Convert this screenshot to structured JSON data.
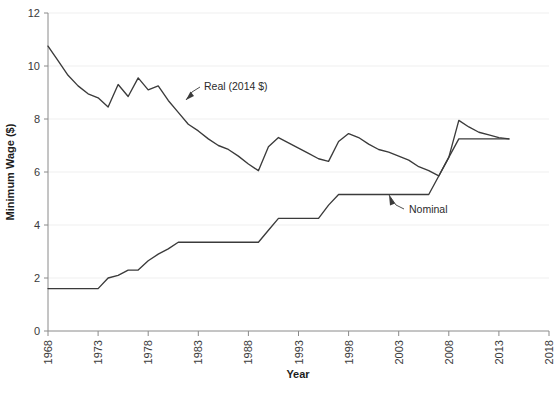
{
  "chart_data": {
    "type": "line",
    "title": "",
    "xlabel": "Year",
    "ylabel": "Minimum Wage ($)",
    "xlim": [
      1968,
      2018
    ],
    "ylim": [
      0,
      12
    ],
    "xticks": [
      1968,
      1973,
      1978,
      1983,
      1988,
      1993,
      1998,
      2003,
      2008,
      2013,
      2018
    ],
    "yticks": [
      0,
      2,
      4,
      6,
      8,
      10,
      12
    ],
    "grid": true,
    "grid_axis": "y",
    "legend": "annotations",
    "annotations": [
      {
        "name": "real-annotation",
        "text": "Real (2014 $)",
        "points_to_year": 1981,
        "points_to_value": 8.25
      },
      {
        "name": "nominal-annotation",
        "text": "Nominal",
        "points_to_year": 2001,
        "points_to_value": 5.15
      }
    ],
    "series": [
      {
        "name": "Real (2014 $)",
        "color": "#3b3b3b",
        "x": [
          1968,
          1969,
          1970,
          1971,
          1972,
          1973,
          1974,
          1975,
          1976,
          1977,
          1978,
          1979,
          1980,
          1981,
          1982,
          1983,
          1984,
          1985,
          1986,
          1987,
          1988,
          1989,
          1990,
          1991,
          1992,
          1993,
          1994,
          1995,
          1996,
          1997,
          1998,
          1999,
          2000,
          2001,
          2002,
          2003,
          2004,
          2005,
          2006,
          2007,
          2008,
          2009,
          2010,
          2011,
          2012,
          2013,
          2014
        ],
        "values": [
          10.75,
          10.2,
          9.65,
          9.25,
          8.95,
          8.8,
          8.45,
          9.3,
          8.85,
          9.55,
          9.1,
          9.25,
          8.7,
          8.25,
          7.8,
          7.55,
          7.25,
          7.0,
          6.85,
          6.6,
          6.3,
          6.05,
          6.95,
          7.3,
          7.1,
          6.9,
          6.7,
          6.5,
          6.4,
          7.15,
          7.45,
          7.3,
          7.05,
          6.85,
          6.75,
          6.6,
          6.45,
          6.2,
          6.05,
          5.85,
          6.55,
          7.95,
          7.7,
          7.5,
          7.4,
          7.3,
          7.25
        ]
      },
      {
        "name": "Nominal",
        "color": "#3b3b3b",
        "x": [
          1968,
          1969,
          1970,
          1971,
          1972,
          1973,
          1974,
          1975,
          1976,
          1977,
          1978,
          1979,
          1980,
          1981,
          1982,
          1983,
          1984,
          1985,
          1986,
          1987,
          1988,
          1989,
          1990,
          1991,
          1992,
          1993,
          1994,
          1995,
          1996,
          1997,
          1998,
          1999,
          2000,
          2001,
          2002,
          2003,
          2004,
          2005,
          2006,
          2007,
          2008,
          2009,
          2010,
          2011,
          2012,
          2013,
          2014
        ],
        "values": [
          1.6,
          1.6,
          1.6,
          1.6,
          1.6,
          1.6,
          2.0,
          2.1,
          2.3,
          2.3,
          2.65,
          2.9,
          3.1,
          3.35,
          3.35,
          3.35,
          3.35,
          3.35,
          3.35,
          3.35,
          3.35,
          3.35,
          3.8,
          4.25,
          4.25,
          4.25,
          4.25,
          4.25,
          4.75,
          5.15,
          5.15,
          5.15,
          5.15,
          5.15,
          5.15,
          5.15,
          5.15,
          5.15,
          5.15,
          5.85,
          6.55,
          7.25,
          7.25,
          7.25,
          7.25,
          7.25,
          7.25
        ]
      }
    ]
  }
}
